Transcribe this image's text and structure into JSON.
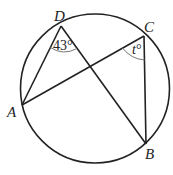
{
  "diagram": {
    "type": "circle-geometry",
    "colors": {
      "stroke": "#222222",
      "arc": "#777777",
      "background": "#ffffff"
    },
    "points": {
      "A": {
        "label": "A"
      },
      "B": {
        "label": "B"
      },
      "C": {
        "label": "C"
      },
      "D": {
        "label": "D"
      }
    },
    "segments": [
      "DA",
      "DB",
      "AC",
      "CB"
    ],
    "angles": {
      "D": {
        "value": "43°",
        "between": [
          "DA",
          "DB"
        ]
      },
      "C": {
        "variable": "t",
        "unit": "°",
        "between": [
          "CA",
          "CB"
        ]
      }
    }
  }
}
